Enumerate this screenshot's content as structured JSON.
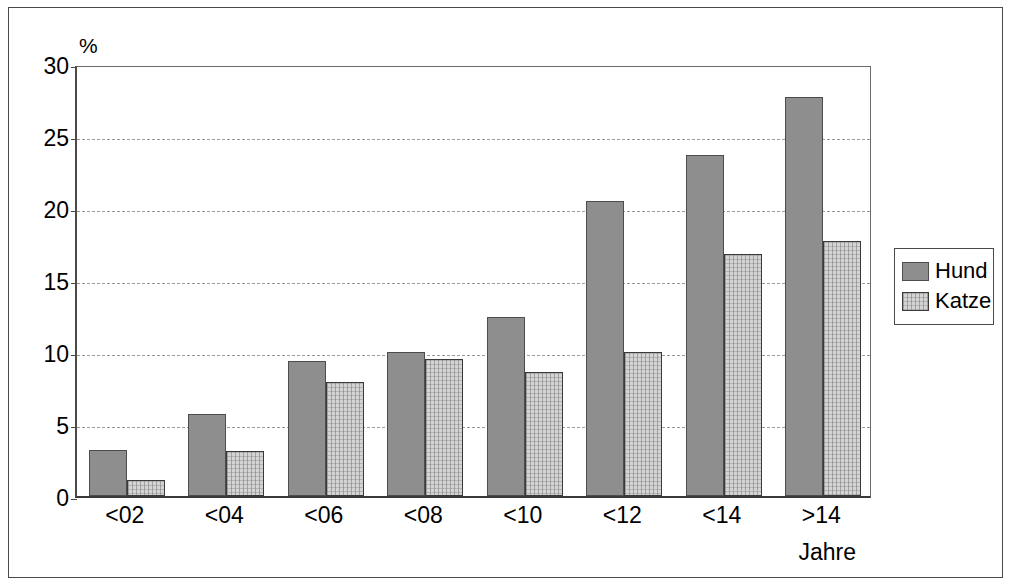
{
  "chart_data": {
    "type": "bar",
    "title": "",
    "subtitle": "",
    "xlabel": "Jahre",
    "ylabel": "%",
    "categories": [
      "<02",
      "<04",
      "<06",
      "<08",
      "<10",
      "<12",
      "<14",
      ">14"
    ],
    "series": [
      {
        "name": "Hund",
        "color": "#8e8e8e",
        "values": [
          3.2,
          5.7,
          9.4,
          10.0,
          12.4,
          20.5,
          23.7,
          27.7
        ]
      },
      {
        "name": "Katze",
        "color": "#d4d4d4",
        "values": [
          1.1,
          3.1,
          7.9,
          9.5,
          8.6,
          10.0,
          16.8,
          17.7
        ]
      }
    ],
    "ylim": [
      0,
      30
    ],
    "ytick_labels": [
      "30",
      "25",
      "20",
      "15",
      "10",
      "5",
      "0"
    ],
    "ytick_values": [
      30,
      25,
      20,
      15,
      10,
      5,
      0
    ],
    "grid": true,
    "grid_axis": "y",
    "legend_position": "right",
    "legend_entries": [
      "Hund",
      "Katze"
    ]
  }
}
